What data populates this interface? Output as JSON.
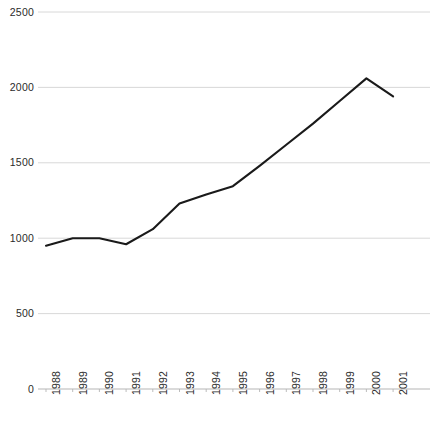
{
  "chart_data": {
    "type": "line",
    "title": "",
    "subtitle": "",
    "xlabel": "",
    "ylabel": "",
    "categories": [
      "1988",
      "1989",
      "1990",
      "1991",
      "1992",
      "1993",
      "1994",
      "1995",
      "1996",
      "1997",
      "1998",
      "1999",
      "2000",
      "2001"
    ],
    "x": [
      1988,
      1989,
      1990,
      1991,
      1992,
      1993,
      1994,
      1995,
      1996,
      1997,
      1998,
      1999,
      2000,
      2001
    ],
    "values": [
      950,
      1000,
      1000,
      960,
      1060,
      1230,
      1290,
      1345,
      1480,
      1620,
      1760,
      1910,
      2060,
      1940
    ],
    "series": [
      {
        "name": "",
        "values": [
          950,
          1000,
          1000,
          960,
          1060,
          1230,
          1290,
          1345,
          1480,
          1620,
          1760,
          1910,
          2060,
          1940
        ]
      }
    ],
    "ylim": [
      0,
      2500
    ],
    "yticks": [
      0,
      500,
      1000,
      1500,
      2000,
      2500
    ],
    "ytick_labels": [
      "0",
      "500",
      "1000",
      "1500",
      "2000",
      "2500"
    ],
    "grid": true,
    "grid_axis": "y",
    "legend": false,
    "legend_position": "none",
    "annotations": [],
    "colors": {
      "line": "#1a1a1a",
      "grid": "#d4d4d4",
      "axis": "#b5b5b5",
      "text": "#2b2b2b",
      "background": "#ffffff"
    },
    "line_width": 2.1,
    "markers": false
  },
  "axes": {
    "y_labels": [
      "2500",
      "2000",
      "1500",
      "1000",
      "500",
      "0"
    ],
    "x_labels": [
      "1988",
      "1989",
      "1990",
      "1991",
      "1992",
      "1993",
      "1994",
      "1995",
      "1996",
      "1997",
      "1998",
      "1999",
      "2000",
      "2001"
    ]
  }
}
